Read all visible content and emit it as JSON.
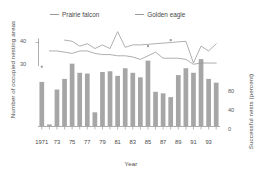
{
  "chart_data": {
    "type": "bar",
    "title": "",
    "xlabel": "Year",
    "ylabel": "Number of occupied nesting areas",
    "ylabel_right": "Successful nests (percent)",
    "x": [
      1971,
      1972,
      1973,
      1974,
      1975,
      1976,
      1977,
      1978,
      1979,
      1980,
      1981,
      1982,
      1983,
      1984,
      1985,
      1986,
      1987,
      1988,
      1989,
      1990,
      1991,
      1992,
      1993,
      1994
    ],
    "categories": [
      "1971",
      "72",
      "73",
      "74",
      "75",
      "76",
      "77",
      "78",
      "79",
      "80",
      "81",
      "82",
      "83",
      "84",
      "85",
      "86",
      "87",
      "88",
      "89",
      "90",
      "91",
      "92",
      "93",
      "94"
    ],
    "xtick_labels": [
      "1971",
      "73",
      "75",
      "77",
      "79",
      "81",
      "83",
      "85",
      "87",
      "89",
      "91",
      "93"
    ],
    "xtick_values": [
      1971,
      1973,
      1975,
      1977,
      1979,
      1981,
      1983,
      1985,
      1987,
      1989,
      1991,
      1993
    ],
    "ylim_left": [
      22,
      46
    ],
    "ytick_labels_left": [
      "40",
      "30"
    ],
    "ytick_values_left": [
      40,
      30
    ],
    "ylim_right": [
      0,
      100
    ],
    "ytick_labels_right": [
      "80",
      "40",
      "0"
    ],
    "ytick_values_right": [
      80,
      40,
      0
    ],
    "grid": false,
    "legend_position": "top",
    "series": [
      {
        "name": "Prairie falcon",
        "kind": "line",
        "axis": "left",
        "color": "#9a9a9a",
        "x": [
          1974,
          1975,
          1976,
          1977,
          1978,
          1979,
          1980,
          1981,
          1982,
          1983,
          1984,
          1990,
          1991,
          1992,
          1993,
          1994
        ],
        "values": [
          41.0,
          40.5,
          38.5,
          39.5,
          37.5,
          39.0,
          37.5,
          44.5,
          38.0,
          39.0,
          39.0,
          40.5,
          31.5,
          38.5,
          36.5,
          39.5
        ]
      },
      {
        "name": "Golden eagle",
        "kind": "line",
        "axis": "left",
        "color": "#9a9a9a",
        "x": [
          1972,
          1973,
          1974,
          1975,
          1976,
          1977,
          1978,
          1979,
          1980,
          1981,
          1982,
          1983,
          1984,
          1985,
          1986,
          1987,
          1988,
          1989,
          1990,
          1991,
          1992,
          1993,
          1994
        ],
        "values": [
          36.5,
          36.5,
          36.0,
          35.5,
          36.5,
          36.5,
          35.5,
          35.0,
          35.0,
          34.5,
          34.5,
          34.0,
          33.0,
          34.5,
          36.0,
          33.5,
          33.5,
          33.5,
          33.0,
          31.0,
          31.5,
          31.5,
          31.5
        ]
      },
      {
        "name": "Successful nests",
        "kind": "bar",
        "axis": "right",
        "color": "#a6a6a6",
        "x": [
          1971,
          1972,
          1973,
          1974,
          1975,
          1976,
          1977,
          1978,
          1979,
          1980,
          1981,
          1982,
          1983,
          1984,
          1985,
          1986,
          1987,
          1988,
          1989,
          1990,
          1991,
          1992,
          1993,
          1994
        ],
        "values": [
          58,
          2,
          48,
          62,
          82,
          70,
          69,
          18,
          71,
          72,
          66,
          76,
          70,
          64,
          86,
          45,
          43,
          38,
          67,
          76,
          70,
          88,
          62,
          57
        ]
      }
    ],
    "markers": [
      {
        "name": "asterisk-marker",
        "x": 1971,
        "y": 30.0
      },
      {
        "name": "asterisk-marker",
        "x": 1985,
        "y": 38.5
      },
      {
        "name": "asterisk-marker",
        "x": 1988,
        "y": 41.0
      }
    ]
  },
  "legend": {
    "items": [
      {
        "label": "Prairie falcon",
        "color": "#9a9a9a"
      },
      {
        "label": "Golden eagle",
        "color": "#9a9a9a"
      }
    ]
  },
  "axes": {
    "left_title": "Number of occupied nesting areas",
    "right_title": "Successful nests (percent)",
    "x_title": "Year",
    "left_tick_40": "40",
    "left_tick_30": "30",
    "right_tick_80": "80",
    "right_tick_40": "40",
    "right_tick_0": "0"
  }
}
